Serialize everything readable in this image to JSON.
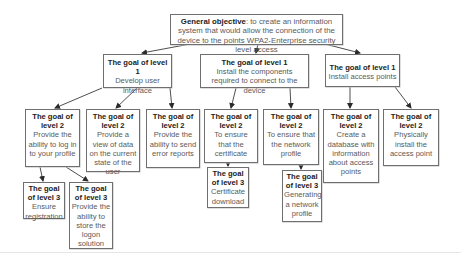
{
  "general_objective": {
    "label": "General objective",
    "text": ": to create an information system that would allow the connection of the device to the points  WPA2-Enterprise security level access"
  },
  "level1": [
    {
      "title": "The goal of level 1",
      "text": "Develop user interface"
    },
    {
      "title": "The goal of level 1",
      "text": "Install the components required to connect to the device"
    },
    {
      "title": "The goal of level 1",
      "text": "Install access points"
    }
  ],
  "level2": [
    {
      "title": "The goal of level 2",
      "text": "Provide the ability to log in to your profile"
    },
    {
      "title": "The goal of level 2",
      "text": "Provide a view of data on the current state of the user"
    },
    {
      "title": "The goal of level 2",
      "text": "Provide the ability to send error reports"
    },
    {
      "title": "The goal of level 2",
      "text": "To ensure that the certificate"
    },
    {
      "title": "The goal of level 2",
      "text": "To ensure that the network profile"
    },
    {
      "title": "The goal of level 2",
      "text": "Create a database with information about access points"
    },
    {
      "title": "The goal of level 2",
      "text": "Physically install the access point"
    }
  ],
  "level3": [
    {
      "title": "The goal of level 3",
      "text": "Ensure registration"
    },
    {
      "title": "The goal of level 3",
      "text": "Provide the ability to store the logon solution"
    },
    {
      "title": "The goal of level 3",
      "text": "Certificate download"
    },
    {
      "title": "The goal of level 3",
      "text": "Generating a network profile"
    }
  ],
  "colors": {
    "border": "#6f6f6f",
    "line": "#3a3a3a",
    "background": "#ffffff"
  }
}
